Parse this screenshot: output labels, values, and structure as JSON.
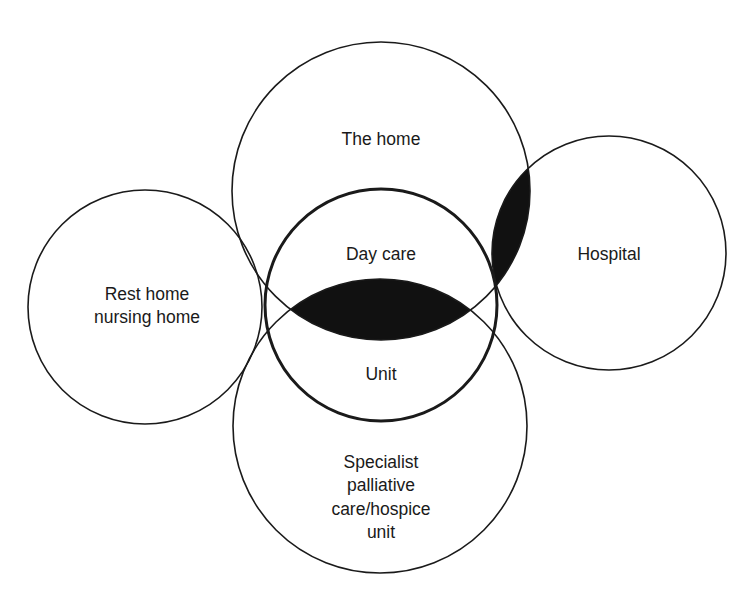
{
  "diagram": {
    "type": "venn",
    "colors": {
      "background": "#ffffff",
      "stroke": "#1a1a1a",
      "shade": "#111111"
    },
    "circles": [
      {
        "id": "the-home",
        "label_lines": [
          "The home"
        ]
      },
      {
        "id": "hospital",
        "label_lines": [
          "Hospital"
        ]
      },
      {
        "id": "rest-home",
        "label_lines": [
          "Rest home",
          "nursing home"
        ]
      },
      {
        "id": "specialist",
        "label_lines": [
          "Specialist",
          "palliative",
          "care/hospice",
          "unit"
        ]
      },
      {
        "id": "day-care-unit",
        "label_lines": [
          "Day care",
          "Unit"
        ]
      }
    ],
    "shaded_regions": [
      {
        "between": [
          "the-home",
          "specialist"
        ]
      },
      {
        "between": [
          "the-home",
          "hospital"
        ]
      }
    ]
  }
}
